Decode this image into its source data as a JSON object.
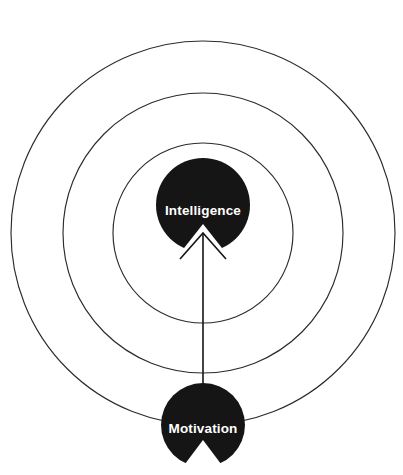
{
  "diagram": {
    "background_color": "#ffffff",
    "stroke_color": "#2b2b2b",
    "node_fill_color": "#151515",
    "node_text_color": "#ffffff",
    "rings": [
      {
        "name": "outer-ring",
        "cx": 203,
        "cy": 233,
        "r": 192
      },
      {
        "name": "middle-ring",
        "cx": 203,
        "cy": 233,
        "r": 140
      },
      {
        "name": "inner-ring",
        "cx": 203,
        "cy": 233,
        "r": 90
      }
    ],
    "nodes": [
      {
        "id": "intelligence",
        "label": "Intelligence",
        "cx": 203,
        "cy": 205,
        "r": 47,
        "label_x": 203,
        "label_y": 210,
        "notch": "bottom-v"
      },
      {
        "id": "motivation",
        "label": "Motivation",
        "cx": 203,
        "cy": 425,
        "r": 42,
        "label_x": 203,
        "label_y": 428,
        "notch": "bottom-v"
      }
    ],
    "connector": {
      "name": "motivation-to-intelligence-arrow",
      "direction": "up",
      "from": "motivation",
      "to": "intelligence",
      "x": 203,
      "y_start": 392,
      "y_end": 233,
      "head_half_width": 23,
      "head_height": 26
    }
  }
}
